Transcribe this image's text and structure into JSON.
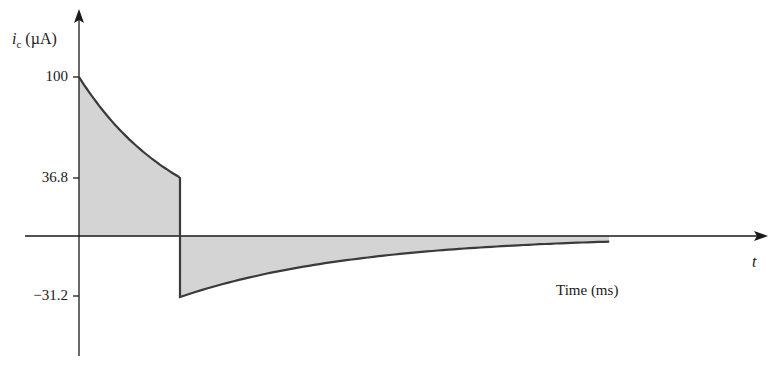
{
  "chart_data": {
    "type": "line",
    "title": "",
    "xlabel": "Time (ms)",
    "x_axis_symbol": "t",
    "ylabel": "i_c (µA)",
    "ylabel_parts": {
      "symbol": "i",
      "subscript": "c",
      "unit": "(µA)"
    },
    "x_units_note": "time in units of the charging time constant (no numeric x ticks shown)",
    "y_ticks": [
      100,
      36.8,
      -31.2
    ],
    "y_tick_labels": [
      "100",
      "36.8",
      "−31.2"
    ],
    "grid": false,
    "legend": null,
    "area_fill": true,
    "series": [
      {
        "name": "charging phase",
        "x": [
          0,
          0.1,
          0.2,
          0.3,
          0.4,
          0.5,
          0.6,
          0.7,
          0.8,
          0.9,
          1.0
        ],
        "values": [
          100,
          90.5,
          81.9,
          74.1,
          67.0,
          60.7,
          54.9,
          49.7,
          44.9,
          40.7,
          36.8
        ]
      },
      {
        "name": "discharging phase",
        "x": [
          1.0,
          1.5,
          2.0,
          2.5,
          3.0,
          3.5,
          4.0,
          4.5,
          5.0,
          5.3
        ],
        "values": [
          -31.2,
          -23.5,
          -17.7,
          -13.4,
          -10.1,
          -7.6,
          -5.7,
          -4.3,
          -3.3,
          -2.8
        ]
      }
    ],
    "annotations": [
      "jump from 36.8 to -31.2 at t = 1 time constant"
    ]
  },
  "labels": {
    "y_axis_symbol": "i",
    "y_axis_sub": "c",
    "y_axis_unit": " (µA)",
    "tick_100": "100",
    "tick_368": "36.8",
    "tick_neg312": "−31.2",
    "t_symbol": "t",
    "x_title": "Time (ms)"
  },
  "colors": {
    "fill": "#d4d4d4",
    "curve": "#3a3a3a",
    "axis": "#1a1a1a"
  }
}
